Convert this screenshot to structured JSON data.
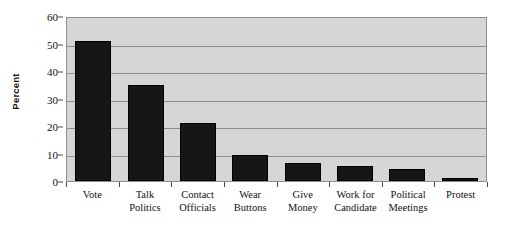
{
  "chart_data": {
    "type": "bar",
    "title": "",
    "subtitle": "",
    "xlabel": "",
    "ylabel": "Percent",
    "ylim": [
      0,
      60
    ],
    "yticks": [
      0,
      10,
      20,
      30,
      40,
      50,
      60
    ],
    "ytick_labels": [
      "0",
      "10",
      "20",
      "30",
      "40",
      "50",
      "60"
    ],
    "grid": "horizontal",
    "legend": "none",
    "orientation": "vertical",
    "bar_color": "#161616",
    "plot_background": "#d6d6d6",
    "gridline_color": "#8e8e8e",
    "categories": [
      "Vote",
      "Talk Politics",
      "Contact Officials",
      "Wear Buttons",
      "Give Money",
      "Work for Candidate",
      "Political Meetings",
      "Protest"
    ],
    "category_lines": [
      [
        "Vote",
        ""
      ],
      [
        "Talk",
        "Politics"
      ],
      [
        "Contact",
        "Officials"
      ],
      [
        "Wear",
        "Buttons"
      ],
      [
        "Give",
        "Money"
      ],
      [
        "Work for",
        "Candidate"
      ],
      [
        "Political",
        "Meetings"
      ],
      [
        "Protest",
        ""
      ]
    ],
    "values": [
      51,
      35,
      21,
      9.5,
      6.5,
      5.5,
      4.3,
      1.2
    ],
    "value_unit": "percent"
  }
}
